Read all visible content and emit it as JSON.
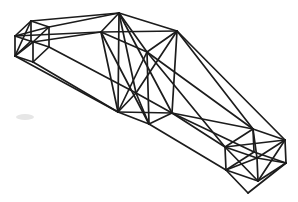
{
  "figure": {
    "type": "wireframe-line-drawing",
    "width": 298,
    "height": 202,
    "background_color": "#ffffff",
    "stroke_color": "#1c1c1c",
    "stroke_width": 1.7,
    "nodes": {
      "A1": [
        15,
        36
      ],
      "A2": [
        31,
        21
      ],
      "A3": [
        49,
        27
      ],
      "A4": [
        33,
        42
      ],
      "A5": [
        15,
        56
      ],
      "A6": [
        31,
        41
      ],
      "A7": [
        49,
        47
      ],
      "A8": [
        33,
        62
      ],
      "T_fl": [
        101,
        32
      ],
      "T_bl": [
        119,
        13
      ],
      "T_fr": [
        147,
        52
      ],
      "T_br": [
        177,
        31
      ],
      "B_fl": [
        118,
        112
      ],
      "B_bl": [
        136,
        93
      ],
      "B_fr": [
        149,
        124
      ],
      "B_br": [
        172,
        113
      ],
      "R_ftl": [
        225,
        147
      ],
      "R_btl": [
        253,
        129
      ],
      "R_btr": [
        285,
        140
      ],
      "R_ftr": [
        257,
        158
      ],
      "R_fbl": [
        226,
        170
      ],
      "R_bbl": [
        254,
        152
      ],
      "R_bbr": [
        286,
        163
      ],
      "R_fbr": [
        258,
        181
      ],
      "S": [
        248,
        193
      ]
    },
    "edges": [
      [
        "A1",
        "A2"
      ],
      [
        "A2",
        "A3"
      ],
      [
        "A3",
        "A4"
      ],
      [
        "A4",
        "A1"
      ],
      [
        "A1",
        "A3"
      ],
      [
        "A1",
        "A5"
      ],
      [
        "A2",
        "A6"
      ],
      [
        "A3",
        "A7"
      ],
      [
        "A4",
        "A8"
      ],
      [
        "A5",
        "A6"
      ],
      [
        "A5",
        "A8"
      ],
      [
        "A6",
        "A7"
      ],
      [
        "A7",
        "A8"
      ],
      [
        "A2",
        "A5"
      ],
      [
        "A4",
        "A5"
      ],
      [
        "A2",
        "T_bl"
      ],
      [
        "A3",
        "T_bl"
      ],
      [
        "A1",
        "T_fl"
      ],
      [
        "A4",
        "T_fl"
      ],
      [
        "A5",
        "B_fl"
      ],
      [
        "A8",
        "B_fl"
      ],
      [
        "A7",
        "B_bl"
      ],
      [
        "T_fl",
        "T_bl"
      ],
      [
        "T_bl",
        "T_br"
      ],
      [
        "T_fl",
        "T_fr"
      ],
      [
        "T_fr",
        "T_br"
      ],
      [
        "T_bl",
        "T_fr"
      ],
      [
        "T_fl",
        "T_br"
      ],
      [
        "T_fl",
        "B_fl"
      ],
      [
        "T_bl",
        "B_bl"
      ],
      [
        "T_fr",
        "B_fr"
      ],
      [
        "T_br",
        "B_br"
      ],
      [
        "T_bl",
        "B_fl"
      ],
      [
        "T_fl",
        "B_fr"
      ],
      [
        "T_fr",
        "B_fl"
      ],
      [
        "T_bl",
        "B_br"
      ],
      [
        "T_br",
        "B_bl"
      ],
      [
        "B_fl",
        "B_bl"
      ],
      [
        "B_bl",
        "B_br"
      ],
      [
        "B_fl",
        "B_fr"
      ],
      [
        "B_fr",
        "B_br"
      ],
      [
        "B_fl",
        "B_br"
      ],
      [
        "B_bl",
        "B_fr"
      ],
      [
        "T_br",
        "R_btr"
      ],
      [
        "T_br",
        "R_btl"
      ],
      [
        "T_fr",
        "R_btl"
      ],
      [
        "T_fr",
        "R_ftl"
      ],
      [
        "B_br",
        "R_btl"
      ],
      [
        "B_br",
        "R_ftl"
      ],
      [
        "B_br",
        "R_bbl"
      ],
      [
        "B_fr",
        "R_fbl"
      ],
      [
        "R_ftl",
        "R_btl"
      ],
      [
        "R_btl",
        "R_btr"
      ],
      [
        "R_btr",
        "R_ftr"
      ],
      [
        "R_ftr",
        "R_ftl"
      ],
      [
        "R_ftl",
        "R_btr"
      ],
      [
        "R_btl",
        "R_ftr"
      ],
      [
        "R_ftl",
        "R_fbl"
      ],
      [
        "R_ftr",
        "R_fbr"
      ],
      [
        "R_fbl",
        "R_fbr"
      ],
      [
        "R_ftl",
        "R_fbr"
      ],
      [
        "R_ftr",
        "R_fbl"
      ],
      [
        "R_btr",
        "R_bbr"
      ],
      [
        "R_bbr",
        "R_fbr"
      ],
      [
        "R_btr",
        "R_fbr"
      ],
      [
        "R_ftr",
        "R_bbr"
      ],
      [
        "R_btl",
        "R_bbl"
      ],
      [
        "R_bbl",
        "R_bbr"
      ],
      [
        "R_fbl",
        "R_bbl"
      ],
      [
        "R_fbl",
        "S"
      ],
      [
        "S",
        "R_bbr"
      ]
    ],
    "artifacts": {
      "smudge": {
        "x": 25,
        "y": 117,
        "rx": 9,
        "ry": 3,
        "color": "#e6e6e6"
      }
    }
  }
}
